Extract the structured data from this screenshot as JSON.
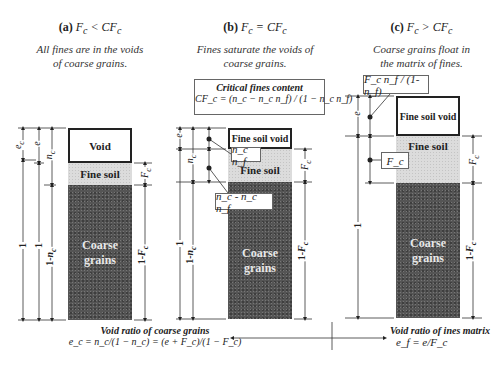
{
  "panels": [
    {
      "id": "a",
      "title_prefix": "(a)",
      "title_expr": "F",
      "title_sub": "c",
      "title_op": " < ",
      "title_rhs": "CF",
      "title_rhs_sub": "c",
      "subtitle_line1": "All fines are in the voids",
      "subtitle_line2": "of coarse grains.",
      "layers": {
        "void": "Void",
        "fine": "Fine soil",
        "coarse_line1": "Coarse",
        "coarse_line2": "grains"
      },
      "dims_left": [
        "e_c",
        "e",
        "n_c",
        "1",
        "1",
        "1-n_c"
      ],
      "dims_right": [
        "F_c",
        "1-F_c"
      ]
    },
    {
      "id": "b",
      "title_prefix": "(b)",
      "title_expr": "F",
      "title_sub": "c",
      "title_op": " = ",
      "title_rhs": "CF",
      "title_rhs_sub": "c",
      "subtitle_line1": "Fines saturate the voids of",
      "subtitle_line2": "coarse grains.",
      "critical_box": {
        "title": "Critical fines content",
        "formula": "CF_c = (n_c − n_c n_f) / (1 − n_c n_f)"
      },
      "layers": {
        "void": "Fine soil void",
        "fine": "Fine soil",
        "coarse_line1": "Coarse",
        "coarse_line2": "grains"
      },
      "callouts": [
        "n_c n_f",
        "n_c - n_c n_f"
      ],
      "dims_left": [
        "e",
        "n_c",
        "1",
        "1-n_c"
      ],
      "dims_right": [
        "F_c",
        "1-F_c"
      ]
    },
    {
      "id": "c",
      "title_prefix": "(c)",
      "title_expr": "F",
      "title_sub": "c",
      "title_op": " > ",
      "title_rhs": "CF",
      "title_rhs_sub": "c",
      "subtitle_line1": "Coarse grains float in",
      "subtitle_line2": "the matrix of fines.",
      "layers": {
        "void": "Fine soil void",
        "fine": "Fine soil",
        "coarse_line1": "Coarse",
        "coarse_line2": "grains"
      },
      "callouts": [
        "F_c n_f / (1-n_f)",
        "F_c"
      ],
      "dims_left": [
        "e",
        "1"
      ],
      "dims_right": [
        "F_c",
        "1-F_c"
      ]
    }
  ],
  "bottom": {
    "left_title": "Void ratio of coarse grains",
    "left_formula": "e_c = n_c/(1 − n_c) = (e + F_c)/(1 − F_c)",
    "right_title": "Void ratio of ines matrix",
    "right_formula": "e_f = e/F_c"
  },
  "colors": {
    "coarse": "#555555",
    "fine": "#dcdcdc",
    "void": "#ffffff",
    "line": "#222222"
  }
}
